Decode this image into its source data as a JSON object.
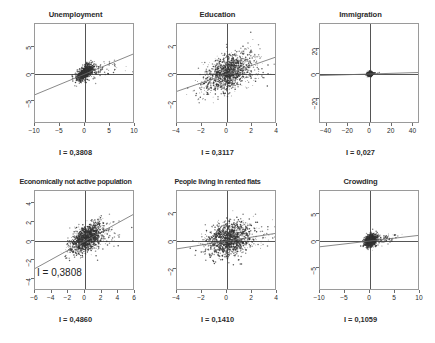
{
  "figure": {
    "layout": "2 rows x 3 columns of Moran scatterplots",
    "background": "#ffffff",
    "point_color": "#3a3a3a",
    "line_color": "#6b6b6b",
    "axis_color": "#555555"
  },
  "chart_data": [
    {
      "type": "scatter",
      "id": "unemployment",
      "title": "Unemployment",
      "xlabel": "",
      "ylabel": "",
      "xlim": [
        -10,
        10
      ],
      "ylim": [
        -9.2,
        9.2
      ],
      "xticks": [
        -10,
        -5,
        0,
        5,
        10
      ],
      "xticklabels": [
        "−10",
        "−5",
        "0",
        "5",
        "10"
      ],
      "yticks": [
        -5,
        0,
        5
      ],
      "yticklabels": [
        "−5",
        "0",
        "5"
      ],
      "grid": false,
      "crosshair_at": [
        0,
        0
      ],
      "regression": {
        "slope": 0.3808,
        "intercept": 0.0
      },
      "annotation": "",
      "caption": "I = 0,3808",
      "cloud": {
        "n": 900,
        "cx": 0.0,
        "cy": 0.3,
        "sx": 0.85,
        "sy": 0.75,
        "corr": 0.62,
        "tail_n": 120,
        "tail_sx": 3.4,
        "tail_sy": 1.1
      }
    },
    {
      "type": "scatter",
      "id": "education",
      "title": "Education",
      "xlabel": "",
      "ylabel": "",
      "xlim": [
        -4,
        4
      ],
      "ylim": [
        -3.6,
        3.6
      ],
      "xticks": [
        -4,
        -2,
        0,
        2,
        4
      ],
      "xticklabels": [
        "−4",
        "−2",
        "0",
        "2",
        "4"
      ],
      "yticks": [
        -2,
        0,
        2
      ],
      "yticklabels": [
        "−2",
        "0",
        "2"
      ],
      "grid": false,
      "crosshair_at": [
        0,
        0
      ],
      "regression": {
        "slope": 0.3117,
        "intercept": 0.0
      },
      "annotation": "",
      "caption": "I = 0,3117",
      "cloud": {
        "n": 1100,
        "cx": 0.05,
        "cy": 0.1,
        "sx": 0.95,
        "sy": 0.72,
        "corr": 0.48,
        "tail_n": 160,
        "tail_sx": 1.6,
        "tail_sy": 0.8
      }
    },
    {
      "type": "scatter",
      "id": "immigration",
      "title": "Immigration",
      "xlabel": "",
      "ylabel": "",
      "xlim": [
        -46,
        46
      ],
      "ylim": [
        -40,
        40
      ],
      "xticks": [
        -40,
        -20,
        0,
        20,
        40
      ],
      "xticklabels": [
        "−40",
        "−20",
        "0",
        "20",
        "40"
      ],
      "yticks": [
        -20,
        0,
        20
      ],
      "yticklabels": [
        "−20",
        "0",
        "20"
      ],
      "grid": false,
      "crosshair_at": [
        0,
        0
      ],
      "regression": {
        "slope": 0.027,
        "intercept": 0.0
      },
      "annotation": "",
      "caption": "I = 0,027",
      "cloud": {
        "n": 700,
        "cx": 0.0,
        "cy": 0.0,
        "sx": 1.2,
        "sy": 0.8,
        "corr": 0.05,
        "tail_n": 40,
        "tail_sx": 4.0,
        "tail_sy": 0.5
      }
    },
    {
      "type": "scatter",
      "id": "economically-not-active-population",
      "title": "Economically not active population",
      "xlabel": "",
      "ylabel": "",
      "xlim": [
        -6,
        6
      ],
      "ylim": [
        -5.3,
        5.3
      ],
      "xticks": [
        -6,
        -4,
        -2,
        0,
        2,
        4,
        6
      ],
      "xticklabels": [
        "−6",
        "−4",
        "−2",
        "0",
        "2",
        "4",
        "6"
      ],
      "yticks": [
        -4,
        -2,
        0,
        2,
        4
      ],
      "yticklabels": [
        "−4",
        "−2",
        "0",
        "2",
        "4"
      ],
      "grid": false,
      "crosshair_at": [
        0,
        0
      ],
      "regression": {
        "slope": 0.486,
        "intercept": 0.0
      },
      "annotation": "I = 0,3808",
      "caption": "I = 0,4860",
      "cloud": {
        "n": 1150,
        "cx": 0.15,
        "cy": 0.3,
        "sx": 0.95,
        "sy": 0.8,
        "corr": 0.55,
        "tail_n": 150,
        "tail_sx": 2.1,
        "tail_sy": 1.0
      }
    },
    {
      "type": "scatter",
      "id": "people-living-in-rented-flats",
      "title": "People living in rented flats",
      "xlabel": "",
      "ylabel": "",
      "xlim": [
        -4,
        4
      ],
      "ylim": [
        -3.6,
        3.6
      ],
      "xticks": [
        -4,
        -2,
        0,
        2,
        4
      ],
      "xticklabels": [
        "−4",
        "−2",
        "0",
        "2",
        "4"
      ],
      "yticks": [
        -2,
        0,
        2
      ],
      "yticklabels": [
        "−2",
        "0",
        "2"
      ],
      "grid": false,
      "crosshair_at": [
        0,
        0
      ],
      "regression": {
        "slope": 0.141,
        "intercept": 0.0
      },
      "annotation": "",
      "caption": "I = 0,1410",
      "cloud": {
        "n": 1100,
        "cx": 0.05,
        "cy": 0.15,
        "sx": 0.85,
        "sy": 0.6,
        "corr": 0.22,
        "tail_n": 180,
        "tail_sx": 1.8,
        "tail_sy": 0.7
      }
    },
    {
      "type": "scatter",
      "id": "crowding",
      "title": "Crowding",
      "xlabel": "",
      "ylabel": "",
      "xlim": [
        -10,
        10
      ],
      "ylim": [
        -9.2,
        9.2
      ],
      "xticks": [
        -10,
        -5,
        0,
        5,
        10
      ],
      "xticklabels": [
        "−10",
        "−5",
        "0",
        "5",
        "10"
      ],
      "yticks": [
        -5,
        0,
        5
      ],
      "yticklabels": [
        "−5",
        "0",
        "5"
      ],
      "grid": false,
      "crosshair_at": [
        0,
        0
      ],
      "regression": {
        "slope": 0.1059,
        "intercept": 0.0
      },
      "annotation": "",
      "caption": "I = 0,1059",
      "cloud": {
        "n": 950,
        "cx": 0.1,
        "cy": 0.1,
        "sx": 0.6,
        "sy": 0.55,
        "corr": 0.3,
        "tail_n": 130,
        "tail_sx": 2.6,
        "tail_sy": 0.55
      }
    }
  ]
}
